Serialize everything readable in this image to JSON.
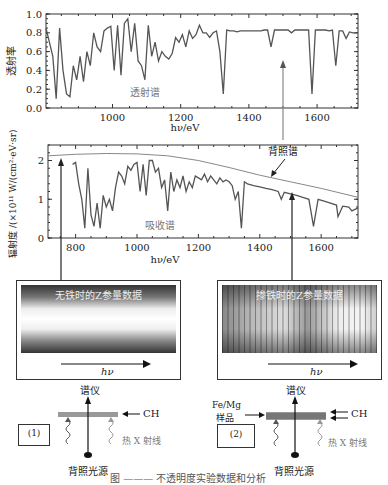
{
  "chart_data": [
    {
      "type": "line",
      "title": "",
      "annotation": "透射谱",
      "xlabel": "hν/eV",
      "ylabel": "透射率",
      "xlim": [
        805,
        1720
      ],
      "ylim": [
        0.0,
        1.0
      ],
      "xticks": [
        1000,
        1200,
        1400,
        1600
      ],
      "yticks": [
        "0.0",
        "0.2",
        "0.4",
        "0.6",
        "0.8",
        "1.0"
      ],
      "yticks_values": [
        0.0,
        0.2,
        0.4,
        0.6,
        0.8,
        1.0
      ],
      "series": [
        {
          "name": "透射谱",
          "x": [
            805,
            815,
            825,
            835,
            845,
            855,
            865,
            875,
            885,
            895,
            905,
            915,
            925,
            935,
            945,
            955,
            965,
            975,
            985,
            995,
            1005,
            1015,
            1025,
            1035,
            1045,
            1055,
            1065,
            1075,
            1085,
            1095,
            1105,
            1115,
            1125,
            1135,
            1145,
            1155,
            1165,
            1175,
            1185,
            1195,
            1205,
            1215,
            1225,
            1235,
            1245,
            1255,
            1265,
            1275,
            1285,
            1295,
            1305,
            1315,
            1325,
            1335,
            1345,
            1355,
            1365,
            1375,
            1385,
            1395,
            1405,
            1415,
            1425,
            1435,
            1445,
            1455,
            1465,
            1475,
            1485,
            1495,
            1505,
            1515,
            1525,
            1535,
            1545,
            1555,
            1565,
            1575,
            1585,
            1595,
            1605,
            1615,
            1625,
            1635,
            1645,
            1655,
            1665,
            1675,
            1685,
            1695,
            1705,
            1715
          ],
          "y": [
            0.85,
            0.7,
            0.55,
            0.1,
            0.85,
            0.4,
            0.15,
            0.12,
            0.45,
            0.3,
            0.55,
            0.28,
            0.6,
            0.45,
            0.8,
            0.65,
            0.6,
            0.82,
            0.85,
            0.87,
            0.4,
            0.88,
            0.35,
            0.9,
            0.95,
            0.6,
            0.9,
            0.5,
            0.45,
            0.3,
            0.88,
            0.55,
            0.7,
            0.5,
            0.6,
            0.55,
            0.52,
            0.58,
            0.75,
            0.7,
            0.78,
            0.65,
            0.82,
            0.74,
            0.78,
            0.88,
            0.8,
            0.8,
            0.75,
            0.8,
            0.82,
            0.6,
            0.15,
            0.83,
            0.82,
            0.82,
            0.81,
            0.82,
            0.82,
            0.82,
            0.82,
            0.82,
            0.82,
            0.82,
            0.83,
            0.83,
            0.65,
            0.83,
            0.83,
            0.83,
            0.83,
            0.83,
            0.8,
            0.83,
            0.83,
            0.83,
            0.83,
            0.83,
            0.15,
            0.83,
            0.83,
            0.83,
            0.83,
            0.82,
            0.83,
            0.45,
            0.82,
            0.82,
            0.74,
            0.81,
            0.8,
            0.8
          ]
        }
      ]
    },
    {
      "type": "line",
      "title": "",
      "annotation": "吸收谱",
      "annotation2": "背照谱",
      "xlabel": "hν/eV",
      "ylabel": "辐射度 /(×10¹¹ W/(cm²·eV·sr))",
      "xlim": [
        710,
        1720
      ],
      "ylim": [
        0,
        2.4
      ],
      "xticks": [
        800,
        1000,
        1200,
        1400,
        1600
      ],
      "yticks": [
        "0",
        "1",
        "2"
      ],
      "yticks_values": [
        0,
        1,
        2
      ],
      "series": [
        {
          "name": "背照谱",
          "x": [
            710,
            800,
            900,
            1000,
            1100,
            1200,
            1300,
            1400,
            1500,
            1600,
            1720
          ],
          "y": [
            2.12,
            2.16,
            2.18,
            2.17,
            2.12,
            2.0,
            1.82,
            1.62,
            1.45,
            1.28,
            1.05
          ]
        },
        {
          "name": "吸收谱",
          "x": [
            790,
            800,
            810,
            820,
            830,
            840,
            850,
            860,
            870,
            880,
            890,
            900,
            910,
            920,
            930,
            940,
            950,
            960,
            970,
            980,
            990,
            1000,
            1010,
            1020,
            1030,
            1040,
            1050,
            1060,
            1070,
            1080,
            1090,
            1100,
            1110,
            1120,
            1130,
            1140,
            1150,
            1160,
            1170,
            1180,
            1190,
            1200,
            1210,
            1220,
            1230,
            1240,
            1250,
            1260,
            1270,
            1280,
            1290,
            1300,
            1310,
            1320,
            1330,
            1340,
            1350,
            1360,
            1380,
            1400,
            1420,
            1440,
            1460,
            1470,
            1480,
            1500,
            1520,
            1540,
            1560,
            1575,
            1590,
            1610,
            1630,
            1650,
            1655,
            1670,
            1690,
            1700,
            1720
          ],
          "y": [
            1.9,
            1.95,
            1.4,
            1.0,
            0.25,
            1.8,
            0.6,
            0.3,
            0.9,
            0.25,
            1.1,
            0.8,
            1.0,
            0.7,
            1.3,
            1.7,
            1.6,
            1.4,
            1.85,
            1.75,
            1.9,
            1.95,
            1.2,
            1.9,
            1.1,
            2.0,
            2.0,
            1.7,
            1.8,
            1.3,
            1.5,
            0.7,
            1.7,
            1.2,
            1.5,
            1.3,
            1.6,
            1.2,
            1.45,
            1.3,
            1.6,
            1.55,
            1.5,
            1.65,
            1.45,
            1.6,
            1.5,
            1.4,
            1.55,
            1.45,
            1.5,
            1.45,
            1.35,
            1.0,
            1.2,
            0.25,
            1.45,
            1.4,
            1.35,
            1.32,
            1.28,
            1.25,
            1.2,
            1.0,
            1.18,
            1.14,
            1.1,
            1.05,
            1.0,
            0.3,
            1.0,
            0.95,
            0.9,
            0.85,
            0.55,
            0.82,
            0.8,
            0.7,
            0.78
          ]
        }
      ]
    }
  ],
  "panels": {
    "left_image_title": "无铁时的Z参量数据",
    "right_image_title": "掺铁时的Z参量数据",
    "hv_label": "hν"
  },
  "diagrams": {
    "left": {
      "spectrometer": "谱仪",
      "ch": "CH",
      "box_label": "(1)",
      "xray": "热 X 射线",
      "source": "背照光源"
    },
    "right": {
      "spectrometer": "谱仪",
      "sample_line1": "Fe/Mg",
      "sample_line2": "样品",
      "ch": "CH",
      "box_label": "(2)",
      "xray": "热 X 射线",
      "source": "背照光源"
    }
  },
  "caption": "图 ——— 不透明度实验数据和分析"
}
